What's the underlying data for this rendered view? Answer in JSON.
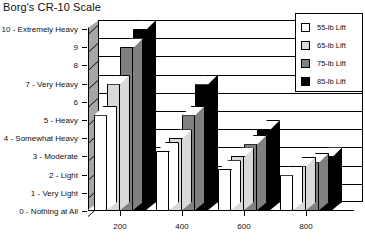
{
  "chart_data": {
    "type": "bar",
    "title": "Borg's CR-10 Scale",
    "xlabel": "",
    "ylabel": "",
    "categories": [
      "200",
      "400",
      "600",
      "800"
    ],
    "series": [
      {
        "name": "55-lb Lift",
        "color": "#ffffff",
        "values": [
          5.3,
          3.3,
          2.3,
          2.0
        ]
      },
      {
        "name": "65-lb Lift",
        "color": "#d9d9d9",
        "values": [
          7.0,
          4.0,
          3.0,
          2.5
        ]
      },
      {
        "name": "75-lb Lift",
        "color": "#808080",
        "values": [
          9.0,
          5.3,
          3.7,
          2.7
        ]
      },
      {
        "name": "85-lb Lift",
        "color": "#000000",
        "values": [
          10.0,
          7.0,
          4.5,
          3.0
        ]
      }
    ],
    "ylim": [
      0,
      10
    ],
    "yticks": [
      0,
      1,
      2,
      3,
      4,
      5,
      6,
      7,
      8,
      9,
      10
    ],
    "ytick_labels": [
      "0 - Nothing at All",
      "1 - Very Light",
      "2 - Light",
      "3 - Moderate",
      "4 - Somewhat Heavy",
      "5 - Heavy",
      "6",
      "7 - Very Heavy",
      "8",
      "9",
      "10 - Extremely Heavy"
    ],
    "grid": true,
    "legend_position": "top-right",
    "style": "3d-column"
  }
}
